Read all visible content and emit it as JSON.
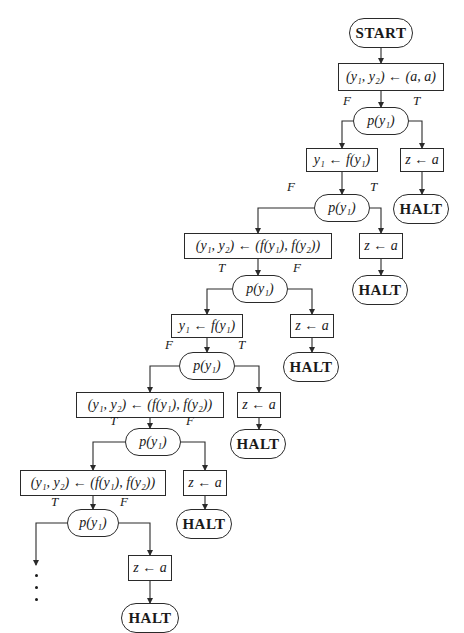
{
  "diagram": {
    "type": "flowchart",
    "colors": {
      "line": "#2a2a2a",
      "text": "#1a1a1a",
      "background": "#ffffff"
    },
    "nodes": [
      {
        "id": "start",
        "kind": "term",
        "label": "START",
        "x": 349,
        "y": 18,
        "w": 64,
        "h": 30
      },
      {
        "id": "init",
        "kind": "stmt",
        "label": "(y₁, y₂) ← (a, a)",
        "x": 338,
        "y": 63,
        "w": 106,
        "h": 28
      },
      {
        "id": "t1",
        "kind": "test",
        "label": "p(y₁)",
        "x": 353,
        "y": 107,
        "w": 56,
        "h": 28
      },
      {
        "id": "s1",
        "kind": "stmt",
        "label": "y₁ ← f(y₁)",
        "x": 306,
        "y": 148,
        "w": 72,
        "h": 24
      },
      {
        "id": "z1",
        "kind": "stmt",
        "label": "z ← a",
        "x": 400,
        "y": 148,
        "w": 44,
        "h": 24
      },
      {
        "id": "h1",
        "kind": "term",
        "label": "HALT",
        "x": 393,
        "y": 194,
        "w": 56,
        "h": 30
      },
      {
        "id": "t2",
        "kind": "test",
        "label": "p(y₁)",
        "x": 314,
        "y": 194,
        "w": 56,
        "h": 28
      },
      {
        "id": "s2",
        "kind": "stmt",
        "label": "(y₁, y₂) ← (f(y₁), f(y₂))",
        "x": 184,
        "y": 233,
        "w": 148,
        "h": 26
      },
      {
        "id": "z2",
        "kind": "stmt",
        "label": "z ← a",
        "x": 359,
        "y": 233,
        "w": 44,
        "h": 26
      },
      {
        "id": "h2",
        "kind": "term",
        "label": "HALT",
        "x": 352,
        "y": 275,
        "w": 56,
        "h": 30
      },
      {
        "id": "t3",
        "kind": "test",
        "label": "p(y₁)",
        "x": 232,
        "y": 275,
        "w": 56,
        "h": 28
      },
      {
        "id": "s3",
        "kind": "stmt",
        "label": "y₁ ← f(y₁)",
        "x": 171,
        "y": 314,
        "w": 72,
        "h": 24
      },
      {
        "id": "z3",
        "kind": "stmt",
        "label": "z ← a",
        "x": 290,
        "y": 314,
        "w": 44,
        "h": 24
      },
      {
        "id": "h3",
        "kind": "term",
        "label": "HALT",
        "x": 283,
        "y": 352,
        "w": 56,
        "h": 30
      },
      {
        "id": "t4",
        "kind": "test",
        "label": "p(y₁)",
        "x": 179,
        "y": 352,
        "w": 56,
        "h": 28
      },
      {
        "id": "s4",
        "kind": "stmt",
        "label": "(y₁, y₂) ← (f(y₁), f(y₂))",
        "x": 76,
        "y": 392,
        "w": 148,
        "h": 26
      },
      {
        "id": "z4",
        "kind": "stmt",
        "label": "z ← a",
        "x": 237,
        "y": 392,
        "w": 44,
        "h": 26
      },
      {
        "id": "h4",
        "kind": "term",
        "label": "HALT",
        "x": 230,
        "y": 429,
        "w": 56,
        "h": 30
      },
      {
        "id": "t5",
        "kind": "test",
        "label": "p(y₁)",
        "x": 125,
        "y": 428,
        "w": 56,
        "h": 28
      },
      {
        "id": "s5",
        "kind": "stmt",
        "label": "(y₁, y₂) ← (f(y₁), f(y₂))",
        "x": 20,
        "y": 470,
        "w": 146,
        "h": 26
      },
      {
        "id": "z5",
        "kind": "stmt",
        "label": "z ← a",
        "x": 183,
        "y": 470,
        "w": 44,
        "h": 26
      },
      {
        "id": "h5",
        "kind": "term",
        "label": "HALT",
        "x": 176,
        "y": 509,
        "w": 56,
        "h": 30
      },
      {
        "id": "t6",
        "kind": "test",
        "label": "p(y₁)",
        "x": 67,
        "y": 509,
        "w": 52,
        "h": 28
      },
      {
        "id": "z6",
        "kind": "stmt",
        "label": "z ← a",
        "x": 128,
        "y": 555,
        "w": 44,
        "h": 26
      },
      {
        "id": "h6",
        "kind": "term",
        "label": "HALT",
        "x": 121,
        "y": 603,
        "w": 58,
        "h": 30
      }
    ],
    "edge_labels": [
      {
        "text": "F",
        "x": 343,
        "y": 107
      },
      {
        "text": "T",
        "x": 413,
        "y": 107
      },
      {
        "text": "F",
        "x": 287,
        "y": 193
      },
      {
        "text": "T",
        "x": 370,
        "y": 193
      },
      {
        "text": "T",
        "x": 218,
        "y": 274
      },
      {
        "text": "F",
        "x": 293,
        "y": 274
      },
      {
        "text": "F",
        "x": 165,
        "y": 351
      },
      {
        "text": "T",
        "x": 238,
        "y": 351
      },
      {
        "text": "T",
        "x": 110,
        "y": 427
      },
      {
        "text": "F",
        "x": 186,
        "y": 427
      },
      {
        "text": "T",
        "x": 51,
        "y": 508
      },
      {
        "text": "F",
        "x": 120,
        "y": 508
      }
    ],
    "continuation": {
      "symbol": "⋮",
      "dots": [
        {
          "x": 36,
          "y": 574
        },
        {
          "x": 36,
          "y": 586
        },
        {
          "x": 36,
          "y": 598
        }
      ]
    },
    "edges": [
      "M381 48 V63",
      "M381 91 V107",
      "M353 121 H342 V148",
      "M409 121 H422 V148",
      "M342 172 V194",
      "M422 172 V194",
      "M314 208 H258 V233",
      "M370 208 H381 V233",
      "M258 259 V275",
      "M381 259 V275",
      "M232 289 H207 V314",
      "M288 289 H312 V314",
      "M207 338 V352",
      "M312 338 V352",
      "M179 366 H150 V392",
      "M235 366 H259 V392",
      "M150 418 V428",
      "M259 418 V429",
      "M125 442 H93 V470",
      "M181 442 H205 V470",
      "M93 496 V509",
      "M205 496 V509",
      "M67 523 H36 V565",
      "M119 523 H150 V555",
      "M150 581 V603"
    ]
  }
}
